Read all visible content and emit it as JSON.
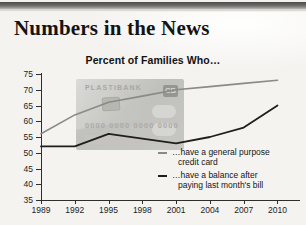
{
  "headline": "Numbers in the News",
  "chart_title": "Percent of Families Who…",
  "watermark_card": {
    "bank_name": "PLASTIBANK",
    "logo_text": "CB",
    "card_number": "0000 0000 0000 0000"
  },
  "legend": [
    {
      "label_line1": "…have a general purpose",
      "label_line2": "credit card",
      "color": "#8a8a86"
    },
    {
      "label_line1": "…have a balance after",
      "label_line2": "paying last month's bill",
      "color": "#1e1e1e"
    }
  ],
  "chart_data": {
    "type": "line",
    "title": "Percent of Families Who…",
    "xlabel": "",
    "ylabel": "",
    "x": [
      1989,
      1992,
      1995,
      1998,
      2001,
      2004,
      2007,
      2010
    ],
    "xticklabels": [
      "1989",
      "1992",
      "1995",
      "1998",
      "2001",
      "2004",
      "2007",
      "2010"
    ],
    "yticklabels": [
      "35",
      "40",
      "45",
      "50",
      "55",
      "60",
      "65",
      "70",
      "75"
    ],
    "xlim": [
      1989,
      2012
    ],
    "ylim": [
      35,
      75
    ],
    "ytick_step": 5,
    "grid": false,
    "legend_position": "inside-right",
    "series": [
      {
        "name": "…have a general purpose credit card",
        "color": "#8a8a86",
        "values": [
          56,
          62,
          66,
          68,
          70,
          71,
          72,
          73
        ]
      },
      {
        "name": "…have a balance after paying last month's bill",
        "color": "#1e1e1e",
        "values": [
          52,
          52,
          56,
          54.5,
          53,
          55,
          58,
          65
        ]
      }
    ]
  }
}
